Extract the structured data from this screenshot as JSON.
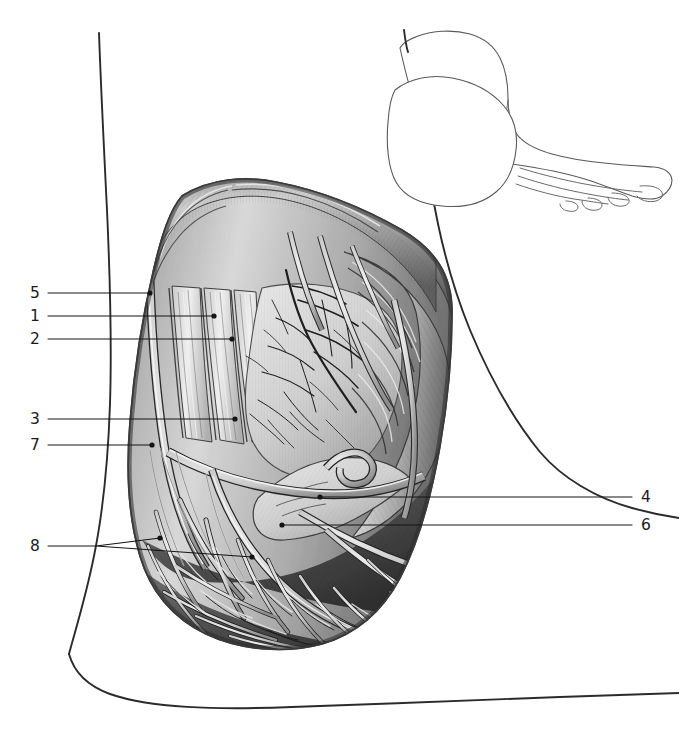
{
  "figure": {
    "kind": "anatomical-illustration",
    "style": "grayscale engraving / airbrush halftone",
    "view": "medial (inner) aspect of right foot, skin and fascia reflected",
    "background_color": "#ffffff",
    "ink_color": "#141414",
    "leader_color": "#141414"
  },
  "inset": {
    "name": "orientation-inset",
    "description": "small line drawing of the whole foot in side view with the dissected window shaded",
    "position": "top-right"
  },
  "labels": {
    "left": [
      {
        "id": "5",
        "text": "5",
        "x": 30,
        "y": 293,
        "leader": "M 48 293 L 150 293",
        "dot": [
          150,
          293
        ]
      },
      {
        "id": "1",
        "text": "1",
        "x": 30,
        "y": 316,
        "leader": "M 48 316 L 214 316",
        "dot": [
          214,
          316
        ]
      },
      {
        "id": "2",
        "text": "2",
        "x": 30,
        "y": 339,
        "leader": "M 48 339 L 232 339",
        "dot": [
          232,
          339
        ]
      },
      {
        "id": "3",
        "text": "3",
        "x": 30,
        "y": 419,
        "leader": "M 48 419 L 235 419",
        "dot": [
          235,
          419
        ]
      },
      {
        "id": "7",
        "text": "7",
        "x": 30,
        "y": 445,
        "leader": "M 48 445 L 152 445",
        "dot": [
          152,
          445
        ]
      },
      {
        "id": "8",
        "text": "8",
        "x": 30,
        "y": 546,
        "leader": "M 48 546 L 96 546 M 96 546 L 160 538 M 96 546 L 252 557",
        "dot": [
          160,
          538
        ],
        "dot2": [
          252,
          557
        ]
      }
    ],
    "right": [
      {
        "id": "4",
        "text": "4",
        "x": 641,
        "y": 497,
        "leader": "M 632 497 L 320 497",
        "dot": [
          320,
          497
        ]
      },
      {
        "id": "6",
        "text": "6",
        "x": 641,
        "y": 525,
        "leader": "M 632 525 L 282 525",
        "dot": [
          282,
          525
        ]
      }
    ]
  },
  "legend_note": "Numbered leader lines 1-8 point to structures in the dissection."
}
